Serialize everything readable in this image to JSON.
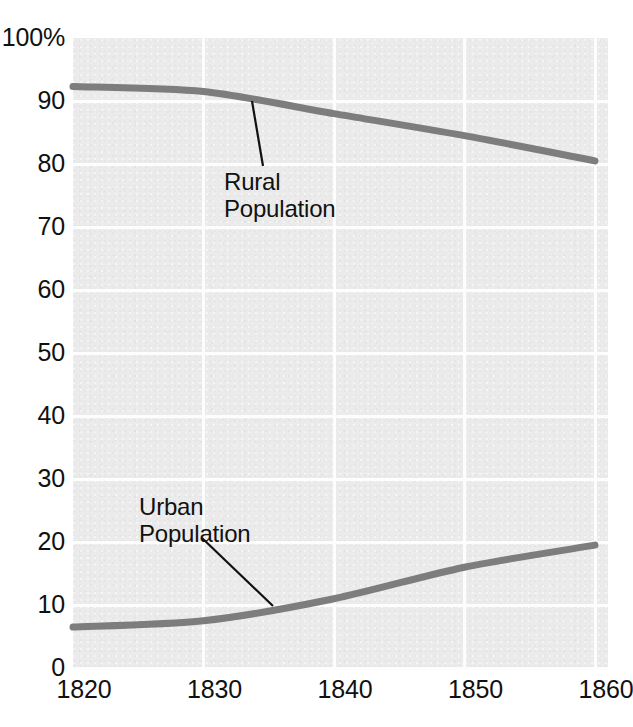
{
  "chart_data": {
    "type": "line",
    "title": "",
    "subtitle": "",
    "xlabel": "",
    "ylabel": "",
    "x": [
      1820,
      1830,
      1840,
      1850,
      1860
    ],
    "xtick_labels": [
      "1820",
      "1830",
      "1840",
      "1850",
      "1860"
    ],
    "ytick_labels": [
      "100%",
      "90",
      "80",
      "70",
      "60",
      "50",
      "40",
      "30",
      "20",
      "10",
      "0"
    ],
    "ytick_values": [
      100,
      90,
      80,
      70,
      60,
      50,
      40,
      30,
      20,
      10,
      0
    ],
    "xlim": [
      1820,
      1861
    ],
    "ylim": [
      0,
      100
    ],
    "grid": "white gridlines, horizontal every 10 units and vertical at each decade",
    "legend": "none - inline annotations with leader lines",
    "plot_background": "#ebebeb",
    "line_color": "#7d7d7d",
    "annotation_color": "#111111",
    "series": [
      {
        "name": "Rural Population",
        "values": [
          92.3,
          91.5,
          88.0,
          84.5,
          80.5
        ],
        "annotation": "Rural\nPopulation"
      },
      {
        "name": "Urban Population",
        "values": [
          6.5,
          7.5,
          11.0,
          16.0,
          19.5
        ],
        "annotation": "Urban\nPopulation"
      }
    ],
    "annotations": [
      {
        "text": "Rural\nPopulation",
        "label_x": 224,
        "label_y": 168,
        "leader_from_x": 263,
        "leader_from_y": 166,
        "leader_to_x": 252,
        "leader_to_y": 101
      },
      {
        "text": "Urban\nPopulation",
        "label_x": 139,
        "label_y": 493,
        "leader_from_x": 202,
        "leader_from_y": 538,
        "leader_to_x": 273,
        "leader_to_y": 606
      }
    ]
  },
  "axes": {
    "y_ticks": [
      {
        "label": "100%",
        "value": 100
      },
      {
        "label": "90",
        "value": 90
      },
      {
        "label": "80",
        "value": 80
      },
      {
        "label": "70",
        "value": 70
      },
      {
        "label": "60",
        "value": 60
      },
      {
        "label": "50",
        "value": 50
      },
      {
        "label": "40",
        "value": 40
      },
      {
        "label": "30",
        "value": 30
      },
      {
        "label": "20",
        "value": 20
      },
      {
        "label": "10",
        "value": 10
      },
      {
        "label": "0",
        "value": 0
      }
    ],
    "x_ticks": [
      {
        "label": "1820",
        "value": 1820
      },
      {
        "label": "1830",
        "value": 1830
      },
      {
        "label": "1840",
        "value": 1840
      },
      {
        "label": "1850",
        "value": 1850
      },
      {
        "label": "1860",
        "value": 1860
      }
    ]
  }
}
